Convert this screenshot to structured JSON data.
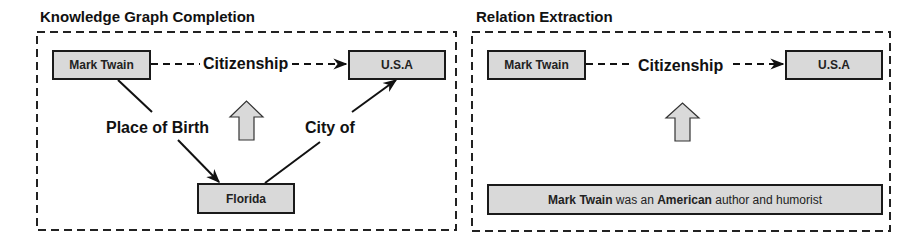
{
  "colors": {
    "node_fill": "#d9d9d9",
    "node_border": "#1a1a1a",
    "arrow_fill": "#d9d9d9",
    "line": "#111111",
    "background": "#ffffff"
  },
  "left_panel": {
    "title": "Knowledge Graph Completion",
    "nodes": {
      "head": "Mark Twain",
      "tail": "U.S.A",
      "intermediate": "Florida"
    },
    "edges": {
      "target": "Citizenship",
      "path1": "Place of Birth",
      "path2": "City of"
    },
    "inference_arrow_icon": "up-arrow-icon"
  },
  "right_panel": {
    "title": "Relation Extraction",
    "nodes": {
      "head": "Mark Twain",
      "tail": "U.S.A"
    },
    "edges": {
      "target": "Citizenship"
    },
    "inference_arrow_icon": "up-arrow-icon",
    "sentence": {
      "part1": "Mark Twain",
      "part2": " was an ",
      "part3": "American",
      "part4": " author and humorist"
    }
  }
}
